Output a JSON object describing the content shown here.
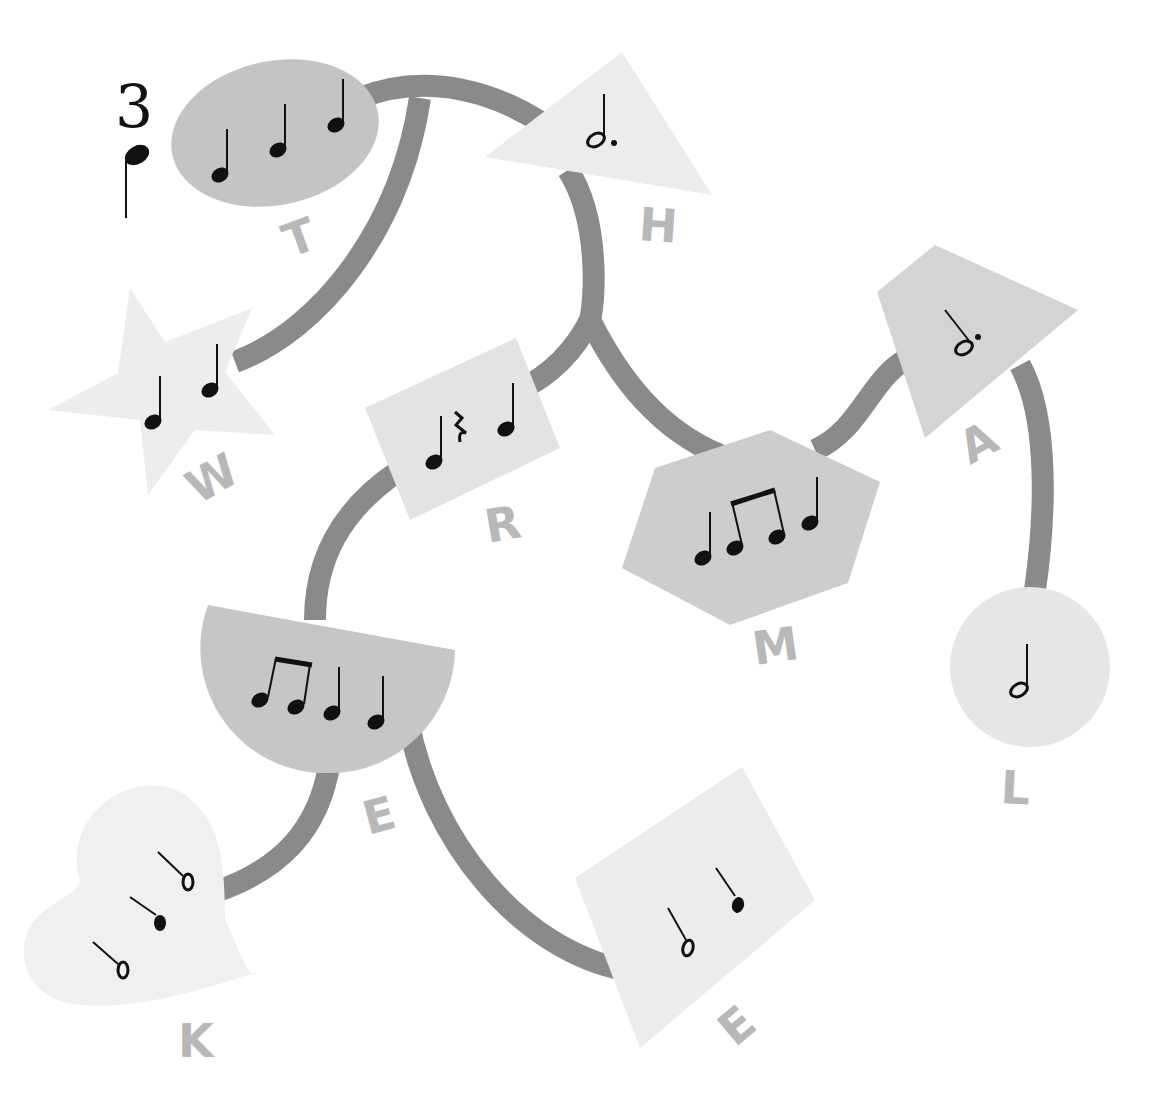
{
  "diagram": {
    "type": "music-rhythm-word-tree",
    "time_signature": {
      "top": "3",
      "bottom_note": "quarter"
    },
    "colors": {
      "background": "#ffffff",
      "path": "#8a8a8a",
      "letter": "#b8b8b8",
      "note": "#111111",
      "shape_dark": "#c4c4c4",
      "shape_mid": "#d2d2d2",
      "shape_light": "#e6e6e6",
      "shape_lighter": "#efefef"
    },
    "nodes": [
      {
        "id": "T",
        "letter": "T",
        "shape": "ellipse",
        "notes": [
          "quarter",
          "quarter",
          "quarter"
        ]
      },
      {
        "id": "H",
        "letter": "H",
        "shape": "triangle",
        "notes": [
          "dotted-half"
        ]
      },
      {
        "id": "W",
        "letter": "W",
        "shape": "star",
        "notes": [
          "quarter",
          "quarter"
        ]
      },
      {
        "id": "R",
        "letter": "R",
        "shape": "rectangle",
        "notes": [
          "quarter",
          "quarter-rest",
          "quarter"
        ]
      },
      {
        "id": "M",
        "letter": "M",
        "shape": "hexagon",
        "notes": [
          "quarter",
          "eighth",
          "eighth",
          "quarter"
        ]
      },
      {
        "id": "A",
        "letter": "A",
        "shape": "kite",
        "notes": [
          "dotted-half"
        ]
      },
      {
        "id": "L",
        "letter": "L",
        "shape": "circle",
        "notes": [
          "half"
        ]
      },
      {
        "id": "E1",
        "letter": "E",
        "shape": "half-circle",
        "notes": [
          "eighth",
          "eighth",
          "quarter",
          "quarter"
        ]
      },
      {
        "id": "K",
        "letter": "K",
        "shape": "heart",
        "notes": [
          "half",
          "quarter",
          "half"
        ]
      },
      {
        "id": "E2",
        "letter": "E",
        "shape": "diamond",
        "notes": [
          "half",
          "quarter"
        ]
      }
    ],
    "edges": [
      [
        "T",
        "H"
      ],
      [
        "T",
        "W"
      ],
      [
        "H",
        "R"
      ],
      [
        "H",
        "M"
      ],
      [
        "M",
        "A"
      ],
      [
        "A",
        "L"
      ],
      [
        "R",
        "E1"
      ],
      [
        "E1",
        "K"
      ],
      [
        "E1",
        "E2"
      ]
    ],
    "labels": {
      "T": "T",
      "H": "H",
      "W": "W",
      "R": "R",
      "M": "M",
      "A": "A",
      "L": "L",
      "E1": "E",
      "K": "K",
      "E2": "E"
    }
  }
}
